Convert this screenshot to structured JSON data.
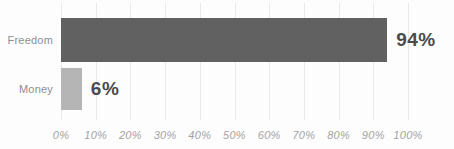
{
  "chart_data": {
    "type": "bar",
    "orientation": "horizontal",
    "title": "",
    "xlabel": "",
    "ylabel": "",
    "categories": [
      "Freedom",
      "Money"
    ],
    "values": [
      94,
      6
    ],
    "value_labels": [
      "94%",
      "6%"
    ],
    "x_ticks": [
      "0%",
      "10%",
      "20%",
      "30%",
      "40%",
      "50%",
      "60%",
      "70%",
      "80%",
      "90%",
      "100%"
    ],
    "x_tick_values": [
      0,
      10,
      20,
      30,
      40,
      50,
      60,
      70,
      80,
      90,
      100
    ],
    "xlim": [
      0,
      100
    ],
    "grid": "vertical-only",
    "legend": "none",
    "bar_colors": [
      "#616161",
      "#b5b5b5"
    ],
    "colors": {
      "background": "#fdfdfd",
      "gridline": "#e9e9e9",
      "category_label": "#8f8f8f",
      "value_label": "#4b4b4b",
      "tick_label": "#a3a3a3"
    }
  }
}
